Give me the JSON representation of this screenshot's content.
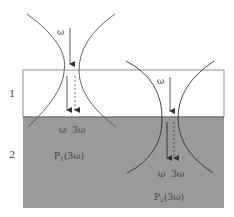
{
  "figure": {
    "colors": {
      "layer1_fill": "#ffffff",
      "layer2_fill": "#9a9a9a",
      "beam_stroke": "#555555",
      "border": "#777777"
    },
    "layers": [
      {
        "label": "1"
      },
      {
        "label": "2"
      }
    ],
    "left_beam": {
      "omega_label": "ω",
      "harmonic_labels": {
        "omega": "ω",
        "third": "3ω"
      },
      "polarization_label": {
        "main": "P",
        "sub": "1",
        "arg": "(3ω)"
      }
    },
    "right_beam": {
      "omega_label": "ω",
      "harmonic_labels": {
        "omega": "ω",
        "third": "3ω"
      },
      "polarization_label": {
        "main": "P",
        "sub": "2",
        "arg": "(3ω)"
      }
    }
  }
}
